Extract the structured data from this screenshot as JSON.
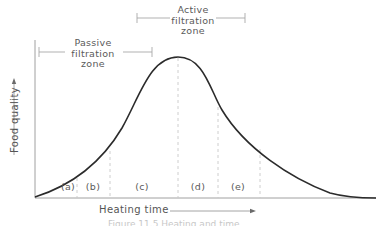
{
  "figure": {
    "zones": {
      "passive": {
        "label": "Passive\nfiltration\nzone"
      },
      "active": {
        "label": "Active\nfiltration\nzone"
      }
    },
    "segments": [
      {
        "label": "(a)"
      },
      {
        "label": "(b)"
      },
      {
        "label": "(c)"
      },
      {
        "label": "(d)"
      },
      {
        "label": "(e)"
      }
    ],
    "y_axis_label": "Food quality",
    "x_axis_label": "Heating time",
    "caption": "Figure 11.5  Heating and time"
  },
  "colors": {
    "curve": "#2b2b2b",
    "axis": "#9a9a9a",
    "dashed": "#c8c8c8",
    "bracket": "#a8a8a8",
    "text": "#5a5a5a"
  }
}
